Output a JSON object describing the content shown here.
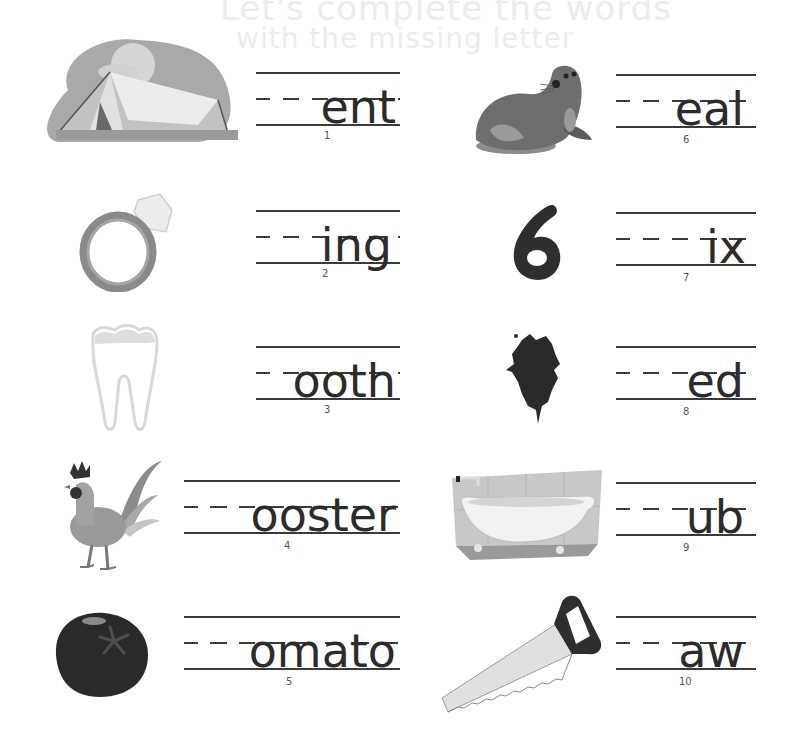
{
  "worksheet": {
    "background_text": [
      "Let's complete the words",
      "with the missing letter"
    ],
    "items": [
      {
        "number": "1",
        "word_ending": "ent",
        "picture": "tent"
      },
      {
        "number": "2",
        "word_ending": "ing",
        "picture": "ring"
      },
      {
        "number": "3",
        "word_ending": "ooth",
        "picture": "tooth"
      },
      {
        "number": "4",
        "word_ending": "ooster",
        "picture": "rooster"
      },
      {
        "number": "5",
        "word_ending": "omato",
        "picture": "tomato"
      },
      {
        "number": "6",
        "word_ending": "eal",
        "picture": "seal"
      },
      {
        "number": "7",
        "word_ending": "ix",
        "picture": "six"
      },
      {
        "number": "8",
        "word_ending": "ed",
        "picture": "red-paint-splat"
      },
      {
        "number": "9",
        "word_ending": "ub",
        "picture": "bathtub"
      },
      {
        "number": "10",
        "word_ending": "aw",
        "picture": "saw"
      }
    ]
  },
  "colors": {
    "line": "#3a3a3a",
    "text": "#2b2b2b",
    "ghost_text": "#ececec"
  }
}
